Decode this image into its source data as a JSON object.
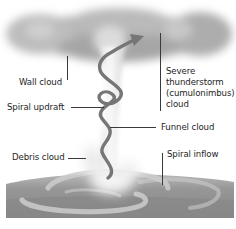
{
  "diagram": {
    "type": "labeled-illustration",
    "labels": {
      "wall_cloud": "Wall cloud",
      "spiral_updraft": "Spiral updraft",
      "debris_cloud": "Debris cloud",
      "severe_storm_line1": "Severe",
      "severe_storm_line2": "thunderstorm",
      "severe_storm_line3": "(cumulonimbus)",
      "severe_storm_line4": "cloud",
      "funnel_cloud": "Funnel cloud",
      "spiral_inflow": "Spiral inflow"
    },
    "colors": {
      "cloud": "#a9a9a9",
      "cloud_light": "#d9d9d9",
      "ground": "#8e8e8e",
      "ground_dark": "#7a7a7a",
      "spiral_arrow": "#737373",
      "inflow_band": "#c8c8c8",
      "label_text": "#1e1e1e",
      "leader_line": "#3a3a3a"
    }
  }
}
